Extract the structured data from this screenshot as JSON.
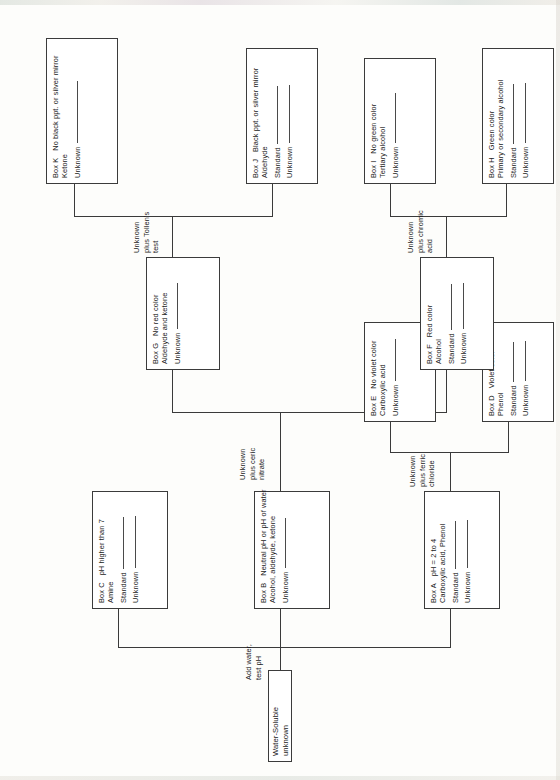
{
  "diagram": {
    "orientation": "rotated-90-ccw",
    "root": {
      "label": "Water-Soluble unknown"
    },
    "steps": {
      "add_water": "Add water,\ntest pH",
      "add_water_l1": "Add water,",
      "add_water_l2": "test pH",
      "ferric_l1": "Unknown",
      "ferric_l2": "plus ferric",
      "ferric_l3": "chloride",
      "ceric_l1": "Unknown",
      "ceric_l2": "plus ceric",
      "ceric_l3": "nitrate",
      "chromic_l1": "Unknown",
      "chromic_l2": "plus chromic",
      "chromic_l3": "acid",
      "tollens_l1": "Unknown",
      "tollens_l2": "plus Tollen's",
      "tollens_l3": "test"
    },
    "boxes": [
      {
        "id": "A",
        "tag": "Box A",
        "result": "pH = 2 to 4",
        "compounds": "Carboxylic acid, Phenol",
        "fields": [
          "Standard",
          "Unknown"
        ]
      },
      {
        "id": "B",
        "tag": "Box B",
        "result": "Neutral pH or pH of water",
        "compounds": "Alcohol, aldehyde, ketone",
        "fields": [
          "Unknown"
        ]
      },
      {
        "id": "C",
        "tag": "Box C",
        "result": "pH higher than 7",
        "compounds": "Amine",
        "fields": [
          "Standard",
          "Unknown"
        ]
      },
      {
        "id": "D",
        "tag": "Box D",
        "result": "Violet color",
        "compounds": "Phenol",
        "fields": [
          "Standard",
          "Unknown"
        ]
      },
      {
        "id": "E",
        "tag": "Box E",
        "result": "No violet color",
        "compounds": "Carboxylic acid",
        "fields": [
          "Unknown"
        ]
      },
      {
        "id": "F",
        "tag": "Box F",
        "result": "Red color",
        "compounds": "Alcohol",
        "fields": [
          "Standard",
          "Unknown"
        ]
      },
      {
        "id": "G",
        "tag": "Box G",
        "result": "No red color",
        "compounds": "Aldehyde and ketone",
        "fields": [
          "Unknown"
        ]
      },
      {
        "id": "H",
        "tag": "Box H",
        "result": "Green color",
        "compounds": "Primary or secondary alcohol",
        "fields": [
          "Standard",
          "Unknown"
        ]
      },
      {
        "id": "I",
        "tag": "Box I",
        "result": "No green color",
        "compounds": "Tertiary alcohol",
        "fields": [
          "Unknown"
        ]
      },
      {
        "id": "J",
        "tag": "Box J",
        "result": "Black ppt. or silver mirror",
        "compounds": "Aldehyde",
        "fields": [
          "Standard",
          "Unknown"
        ]
      },
      {
        "id": "K",
        "tag": "Box K",
        "result": "No black ppt. or silver mirror",
        "compounds": "Ketone",
        "fields": [
          "Unknown"
        ]
      }
    ],
    "colors": {
      "ink": "#1b1b1b",
      "rule": "#3b3b3b",
      "paper": "#ffffff"
    }
  }
}
